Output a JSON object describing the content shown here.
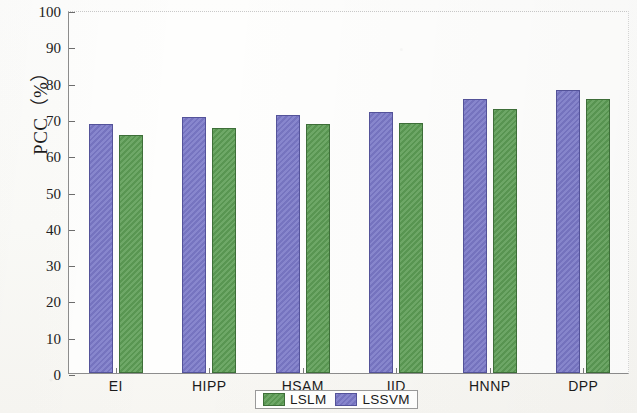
{
  "chart_data": {
    "type": "bar",
    "title": "",
    "xlabel": "",
    "ylabel": "PCC（%）",
    "ylim": [
      0,
      100
    ],
    "yticks": [
      0,
      10,
      20,
      30,
      40,
      50,
      60,
      70,
      80,
      90,
      100
    ],
    "ytick_labels": [
      "0",
      "10",
      "20",
      "30",
      "40",
      "50",
      "60",
      "70",
      "80",
      "90",
      "100"
    ],
    "grid": false,
    "legend_position": "bottom-center",
    "categories": [
      "EI",
      "HIPP",
      "HSAM",
      "IID",
      "HNNP",
      "DPP"
    ],
    "series": [
      {
        "name": "LSLM",
        "color": "#5e9e56",
        "values": [
          65.5,
          67.5,
          68.5,
          69.0,
          72.7,
          75.5
        ]
      },
      {
        "name": "LSSVM",
        "color": "#7b79c8",
        "values": [
          68.6,
          70.5,
          71.0,
          72.0,
          75.5,
          78.0
        ]
      }
    ],
    "series_draw_order": [
      "LSSVM",
      "LSLM"
    ]
  },
  "legend": {
    "entries": [
      {
        "label": "LSLM",
        "swatch": "green-swatch-icon"
      },
      {
        "label": "LSSVM",
        "swatch": "blue-swatch-icon"
      }
    ]
  }
}
